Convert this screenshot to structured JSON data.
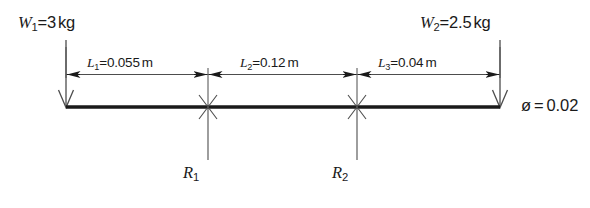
{
  "diagram": {
    "type": "beam-free-body-diagram",
    "colors": {
      "beam": "#1a1a1a",
      "line": "#4d4d4d",
      "text": "#1a1a1a",
      "background": "#ffffff"
    },
    "loads": [
      {
        "id": "W1",
        "symbol": "W",
        "subscript": "1",
        "equals": "=",
        "value": "3",
        "unit": "kg",
        "full_text": "W1 = 3 kg",
        "direction": "down",
        "position": "left-end"
      },
      {
        "id": "W2",
        "symbol": "W",
        "subscript": "2",
        "equals": "=",
        "value": "2.5",
        "unit": "kg",
        "full_text": "W2 = 2.5 kg",
        "direction": "down",
        "position": "right-end"
      }
    ],
    "dimensions": [
      {
        "id": "L1",
        "symbol": "L",
        "subscript": "1",
        "equals": "=",
        "value": "0.055",
        "unit": "m",
        "full_text": "L1 = 0.055 m",
        "from": "W1",
        "to": "R1"
      },
      {
        "id": "L2",
        "symbol": "L",
        "subscript": "2",
        "equals": "=",
        "value": "0.12",
        "unit": "m",
        "full_text": "L2 = 0.12 m",
        "from": "R1",
        "to": "R2"
      },
      {
        "id": "L3",
        "symbol": "L",
        "subscript": "3",
        "equals": "=",
        "value": "0.04",
        "unit": "m",
        "full_text": "L3 = 0.04 m",
        "from": "R2",
        "to": "W2"
      }
    ],
    "reactions": [
      {
        "id": "R1",
        "symbol": "R",
        "subscript": "1",
        "full_text": "R1",
        "direction": "up"
      },
      {
        "id": "R2",
        "symbol": "R",
        "subscript": "2",
        "full_text": "R2",
        "direction": "up"
      }
    ],
    "note": {
      "id": "diameter",
      "symbol": "ø",
      "equals": "=",
      "value": "0.02",
      "full_text": "ø = 0.02"
    }
  }
}
